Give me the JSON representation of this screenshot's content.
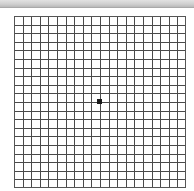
{
  "figure": {
    "type": "amsler-grid",
    "label": "Amsler grid",
    "rows": 20,
    "columns": 20,
    "line_color": "#4a4a4a",
    "border_color": "#555555",
    "background_color": "#ffffff",
    "center_dot_color": "#1a1a1a",
    "top_band_color": "#cfcfcf"
  }
}
